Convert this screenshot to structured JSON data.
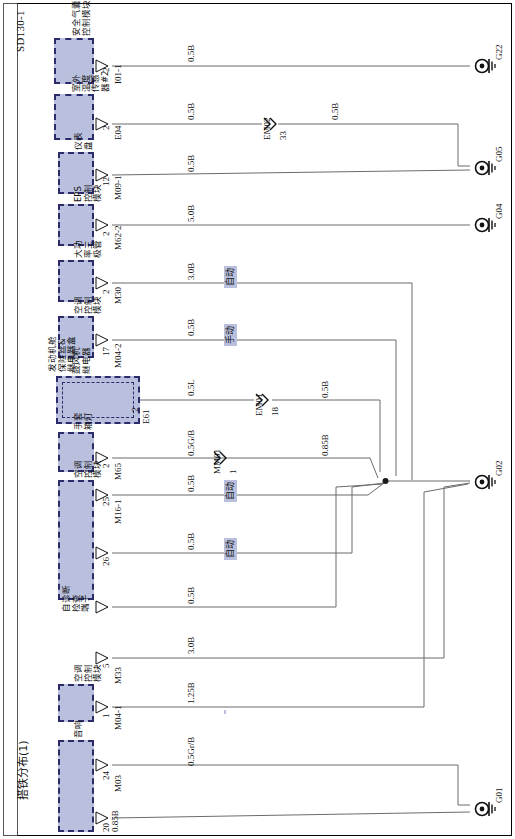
{
  "sheet": {
    "id": "SD130-1",
    "footer": "搭铁分布(1)"
  },
  "components": [
    {
      "key": "airbag",
      "name": "安全气囊\n控制模块",
      "connector": "I01-1",
      "pins": [
        "2"
      ]
    },
    {
      "key": "oat",
      "name": "室外\n温度\n传感\n器#2",
      "connector": "E04",
      "pins": [
        "2"
      ]
    },
    {
      "key": "cluster",
      "name": "仪表\n盘",
      "connector": "M09-1",
      "pins": [
        "12"
      ]
    },
    {
      "key": "eps",
      "name": "EPS\n控制\n模块",
      "connector": "M62-2",
      "pins": [
        "2"
      ]
    },
    {
      "key": "power_tr",
      "name": "大功\n率三\n极管",
      "connector": "M30",
      "pins": [
        "2"
      ]
    },
    {
      "key": "hvac2",
      "name": "空调\n控制\n模块",
      "connector": "M04-2",
      "pins": [
        "17"
      ]
    },
    {
      "key": "fusebox",
      "name": "发动机舱\n保险丝&\n继电器盒",
      "connector": "",
      "pins": []
    },
    {
      "key": "blower",
      "name": "鼓风机\n继电器",
      "connector": "E61",
      "pins": [
        "2"
      ]
    },
    {
      "key": "glove",
      "name": "手套\n箱灯",
      "connector": "M65",
      "pins": [
        "2"
      ]
    },
    {
      "key": "hvac16",
      "name": "空调\n控制\n模块",
      "connector": "M16-1",
      "pins": [
        "25",
        "26"
      ]
    },
    {
      "key": "dlc",
      "name": "自诊断\n检查\n端子",
      "connector": "M33",
      "pins": [
        "5"
      ]
    },
    {
      "key": "hvac1",
      "name": "空调\n控制\n模块",
      "connector": "M04-1",
      "pins": [
        "1"
      ]
    },
    {
      "key": "audio",
      "name": "音响",
      "connector": "M03",
      "pins": [
        "24",
        "20"
      ]
    }
  ],
  "wires": [
    {
      "id": "w1",
      "gauge": "0.5B",
      "from": "I01-1 / 2",
      "to": "G22",
      "mode": ""
    },
    {
      "id": "w2",
      "gauge": "0.5B",
      "from": "E04 / 2",
      "to": "EM02",
      "mode": ""
    },
    {
      "id": "w2b",
      "gauge": "0.5B",
      "from": "EM02 / 33",
      "to": "G05",
      "mode": ""
    },
    {
      "id": "w3",
      "gauge": "0.5B",
      "from": "M09-1 / 12",
      "to": "G05",
      "mode": ""
    },
    {
      "id": "w4",
      "gauge": "5.0B",
      "from": "M62-2 / 2",
      "to": "G04",
      "mode": ""
    },
    {
      "id": "w5",
      "gauge": "3.0B",
      "from": "M30 / 2",
      "to": "G02",
      "mode": "自动"
    },
    {
      "id": "w6",
      "gauge": "0.5B",
      "from": "M04-2 / 17",
      "to": "G02",
      "mode": "手动"
    },
    {
      "id": "w7",
      "gauge": "0.5L",
      "from": "E61 / 2",
      "to": "EM01",
      "mode": ""
    },
    {
      "id": "w7b",
      "gauge": "0.5B",
      "from": "MM01 / 18",
      "to": "G02",
      "mode": ""
    },
    {
      "id": "w8",
      "gauge": "0.5G/B",
      "from": "M65 / 2",
      "to": "G02",
      "mode": ""
    },
    {
      "id": "w8b",
      "gauge": "0.85B",
      "from": "MM01 / 1",
      "to": "G02",
      "mode": ""
    },
    {
      "id": "w9",
      "gauge": "0.5B",
      "from": "M16-1 / 25",
      "to": "G02",
      "mode": "自动"
    },
    {
      "id": "w10",
      "gauge": "0.5B",
      "from": "M16-1 / 26",
      "to": "G02",
      "mode": "自动"
    },
    {
      "id": "w11",
      "gauge": "0.5B",
      "from": "M33 / 5",
      "to": "G02",
      "mode": ""
    },
    {
      "id": "w12",
      "gauge": "3.0B",
      "from": "M04-1 / 1",
      "to": "G01",
      "mode": "手动"
    },
    {
      "id": "w13",
      "gauge": "1.25B",
      "from": "M03 / 24",
      "to": "G01",
      "mode": ""
    },
    {
      "id": "w14",
      "gauge": "0.5Gr/B",
      "from": "M03 / 20",
      "to": "G01",
      "mode": ""
    },
    {
      "id": "trunk",
      "gauge": "0.85B",
      "from": "junction",
      "to": "G02",
      "mode": ""
    }
  ],
  "inline_connectors": [
    {
      "id": "EM02",
      "pin": "33",
      "type": "female"
    },
    {
      "id": "EM01",
      "pin": "18",
      "type": "female"
    },
    {
      "id": "MM01",
      "pin": "1",
      "type": "male"
    }
  ],
  "grounds": [
    {
      "id": "G22"
    },
    {
      "id": "G05"
    },
    {
      "id": "G04"
    },
    {
      "id": "G02"
    },
    {
      "id": "G01"
    }
  ],
  "colors": {
    "component_fill": "#b9c0de",
    "component_border": "#2b2b6b",
    "wire": "#6b6b6b",
    "text": "#111111",
    "tag_bg": "#b9c0de"
  }
}
